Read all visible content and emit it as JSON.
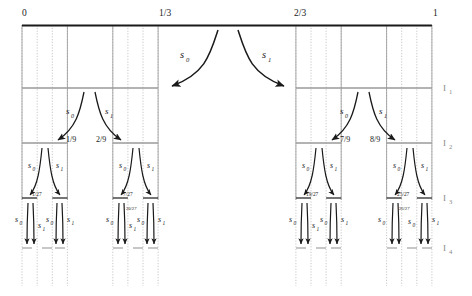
{
  "figure": {
    "colors": {
      "ink": "#1a1a1a",
      "level_rule": "#9a9a9a",
      "dotted_guide": "#b0b0b0",
      "level_label": "#8a8a8a",
      "background": "#ffffff"
    },
    "axis": {
      "name": "unit-interval-axis",
      "ticks": [
        {
          "label": "0",
          "value": 0
        },
        {
          "label": "1/3",
          "value": 0.3333
        },
        {
          "label": "2/3",
          "value": 0.6667
        },
        {
          "label": "1",
          "value": 1
        }
      ]
    },
    "level_labels": [
      {
        "base": "I",
        "sub": "1"
      },
      {
        "base": "I",
        "sub": "2"
      },
      {
        "base": "I",
        "sub": "3"
      },
      {
        "base": "I",
        "sub": "4"
      }
    ],
    "maps": {
      "s0": {
        "base": "s",
        "sub": "0"
      },
      "s1": {
        "base": "s",
        "sub": "1"
      }
    },
    "level1_arrows": [
      {
        "name": "s0-top",
        "base": "s",
        "sub": "0"
      },
      {
        "name": "s1-top",
        "base": "s",
        "sub": "1"
      }
    ],
    "level2_fractions": [
      {
        "label": "1/9"
      },
      {
        "label": "2/9"
      },
      {
        "label": "7/9"
      },
      {
        "label": "8/9"
      }
    ],
    "level3_fractions": [
      {
        "label": "1/27"
      },
      {
        "label": "7/27"
      },
      {
        "label": "19/27"
      },
      {
        "label": "25/27"
      }
    ],
    "level4_fractions": [
      {
        "label": "20/27"
      },
      {
        "label": "26/27"
      }
    ]
  }
}
